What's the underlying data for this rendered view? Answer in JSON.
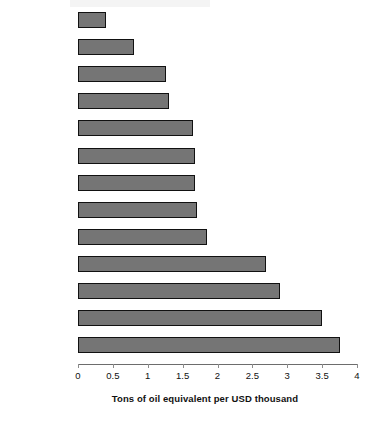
{
  "chart_data": {
    "type": "bar",
    "orientation": "horizontal",
    "title": "",
    "subtitle": "",
    "xlabel": "Tons of oil equivalent per USD thousand",
    "ylabel": "",
    "xlim": [
      0,
      4
    ],
    "ylim": null,
    "grid": false,
    "legend": null,
    "legend_position": "none",
    "xticks": [
      "0",
      "0.5",
      "1",
      "1.5",
      "2",
      "2.5",
      "3",
      "3.5",
      "4"
    ],
    "xtick_values": [
      0,
      0.5,
      1,
      1.5,
      2,
      2.5,
      3,
      3.5,
      4
    ],
    "categories": [
      "OECD Europe",
      "Hungary",
      "Poland",
      "Belarus",
      "Bulgaria",
      "Estonia",
      "Czech Republic",
      "Romania",
      "Slovakia",
      "Russia",
      "Ukraine",
      "Kazakhstan",
      "Uzbekistan"
    ],
    "values": [
      0.4,
      0.8,
      1.26,
      1.3,
      1.65,
      1.68,
      1.68,
      1.7,
      1.85,
      2.7,
      2.9,
      3.5,
      3.75
    ],
    "bar_color": "#757575",
    "bar_border_color": "#111111",
    "axis_color": "#6d6d6d",
    "text_color": "#111111",
    "background_color": "#ffffff"
  }
}
